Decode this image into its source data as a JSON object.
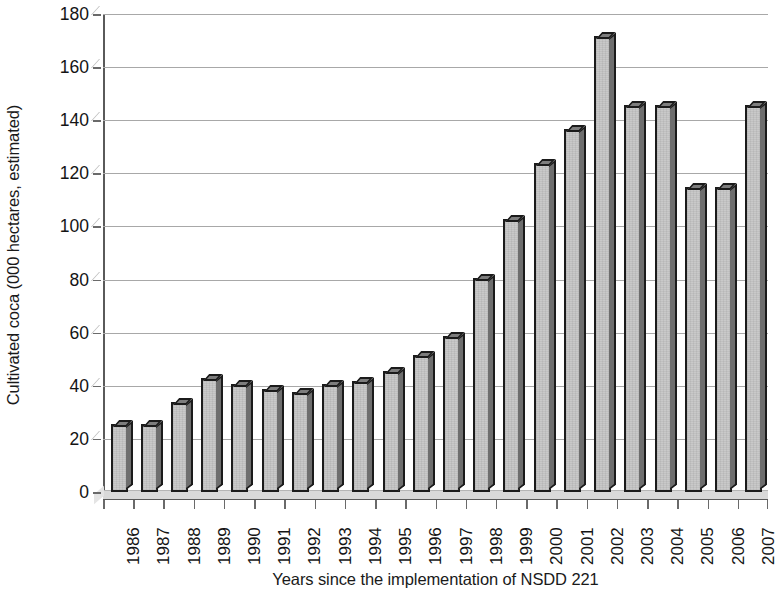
{
  "chart_data": {
    "type": "bar",
    "title": "",
    "xlabel": "Years since the implementation of NSDD 221",
    "ylabel": "Cultivated coca (000 hectares, estimated)",
    "categories": [
      "1986",
      "1987",
      "1988",
      "1989",
      "1990",
      "1991",
      "1992",
      "1993",
      "1994",
      "1995",
      "1996",
      "1997",
      "1998",
      "1999",
      "2000",
      "2001",
      "2002",
      "2003",
      "2004",
      "2005",
      "2006",
      "2007"
    ],
    "values": [
      25,
      25,
      33,
      42,
      40,
      38,
      37,
      40,
      41,
      45,
      51,
      58,
      80,
      102,
      123,
      136,
      171,
      145,
      145,
      114,
      114,
      145
    ],
    "ylim": [
      0,
      180
    ],
    "y_ticks": [
      0,
      20,
      40,
      60,
      80,
      100,
      120,
      140,
      160,
      180
    ],
    "y_tick_labels": [
      "0",
      "20",
      "40",
      "60",
      "80",
      "100",
      "120",
      "140",
      "160",
      "180"
    ],
    "grid": "horizontal",
    "legend": "none",
    "bar_fill_color": "#c9c9c9",
    "bar_edge_color": "#1b1b1b",
    "bar_side_color": "#6e6e6e",
    "gridline_color": "#a8a8a8",
    "axis_color": "#5a5a5a",
    "background_color": "#ffffff",
    "style": "3d-column"
  }
}
